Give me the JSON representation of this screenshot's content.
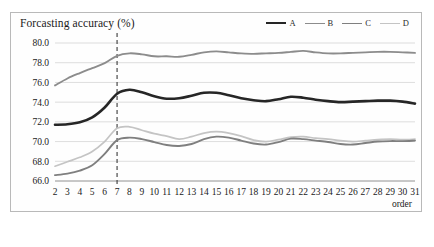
{
  "figure": {
    "title": "Forcasting accuracy (%)",
    "xlabel": "order",
    "caption": ""
  },
  "legend": {
    "position": "top-right",
    "items": [
      {
        "label": "A",
        "color": "#262626",
        "width": 2.6
      },
      {
        "label": "B",
        "color": "#8c8c8c",
        "width": 1.8
      },
      {
        "label": "C",
        "color": "#7f7f7f",
        "width": 1.8
      },
      {
        "label": "D",
        "color": "#c4c4c4",
        "width": 1.6
      }
    ]
  },
  "axes": {
    "y_ticks": [
      "80.0",
      "78.0",
      "76.0",
      "74.0",
      "72.0",
      "70.0",
      "68.0",
      "66.0"
    ],
    "x_ticks": [
      "2",
      "3",
      "4",
      "5",
      "6",
      "7",
      "8",
      "9",
      "10",
      "11",
      "12",
      "13",
      "14",
      "15",
      "16",
      "17",
      "18",
      "19",
      "20",
      "21",
      "22",
      "23",
      "24",
      "25",
      "26",
      "27",
      "28",
      "29",
      "30",
      "31"
    ]
  },
  "annotations": {
    "reference_line": {
      "x": 7,
      "style": "dashed",
      "color": "#3a3a3a"
    }
  },
  "chart_data": {
    "type": "line",
    "title": "Forcasting accuracy (%)",
    "xlabel": "order",
    "ylabel": "Forcasting accuracy (%)",
    "xlim": [
      2,
      31
    ],
    "ylim": [
      66.0,
      80.0
    ],
    "grid": true,
    "legend_position": "top-right",
    "x": [
      2,
      3,
      4,
      5,
      6,
      7,
      8,
      9,
      10,
      11,
      12,
      13,
      14,
      15,
      16,
      17,
      18,
      19,
      20,
      21,
      22,
      23,
      24,
      25,
      26,
      27,
      28,
      29,
      30,
      31
    ],
    "series": [
      {
        "name": "A",
        "color": "#262626",
        "values": [
          71.7,
          71.75,
          71.95,
          72.45,
          73.45,
          74.85,
          75.25,
          75.0,
          74.6,
          74.35,
          74.4,
          74.65,
          74.95,
          74.95,
          74.7,
          74.4,
          74.2,
          74.1,
          74.3,
          74.55,
          74.45,
          74.25,
          74.1,
          74.0,
          74.05,
          74.1,
          74.15,
          74.15,
          74.05,
          73.85
        ]
      },
      {
        "name": "B",
        "color": "#8c8c8c",
        "values": [
          75.7,
          76.4,
          76.95,
          77.45,
          77.95,
          78.7,
          78.95,
          78.85,
          78.65,
          78.65,
          78.6,
          78.8,
          79.05,
          79.15,
          79.05,
          78.95,
          78.9,
          78.95,
          79.0,
          79.1,
          79.2,
          79.05,
          78.95,
          78.95,
          79.0,
          79.05,
          79.1,
          79.1,
          79.05,
          79.0
        ]
      },
      {
        "name": "C",
        "color": "#7f7f7f",
        "values": [
          66.6,
          66.75,
          67.05,
          67.6,
          68.75,
          70.15,
          70.4,
          70.25,
          69.95,
          69.65,
          69.55,
          69.75,
          70.25,
          70.5,
          70.4,
          70.1,
          69.8,
          69.7,
          69.95,
          70.3,
          70.25,
          70.1,
          69.95,
          69.75,
          69.7,
          69.85,
          70.0,
          70.05,
          70.05,
          70.1
        ]
      },
      {
        "name": "D",
        "color": "#c4c4c4",
        "values": [
          67.5,
          67.95,
          68.4,
          69.0,
          70.0,
          71.35,
          71.5,
          71.15,
          70.8,
          70.55,
          70.25,
          70.5,
          70.85,
          71.0,
          70.85,
          70.55,
          70.15,
          70.0,
          70.2,
          70.45,
          70.5,
          70.35,
          70.25,
          70.1,
          70.0,
          70.1,
          70.2,
          70.25,
          70.2,
          70.25
        ]
      }
    ]
  }
}
